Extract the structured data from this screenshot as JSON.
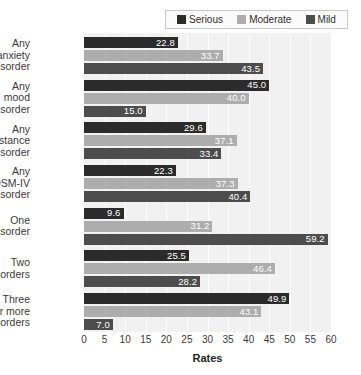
{
  "chart_data": {
    "type": "bar",
    "orientation": "horizontal",
    "title": "",
    "xlabel": "Rates",
    "ylabel": "",
    "xlim": [
      0,
      60
    ],
    "xticks": [
      0,
      5,
      10,
      15,
      20,
      25,
      30,
      35,
      40,
      45,
      50,
      55,
      60
    ],
    "grid": true,
    "legend_position": "top-right",
    "categories": [
      "Any anxiety disorder",
      "Any mood disorder",
      "Any substance use disorder",
      "Any DSM-IV disorder",
      "One disorder",
      "Two disorders",
      "Three or more disorders"
    ],
    "category_lines": [
      [
        "Any",
        "anxiety",
        "disorder"
      ],
      [
        "Any",
        "mood",
        "disorder"
      ],
      [
        "Any",
        "substance",
        "use disorder"
      ],
      [
        "Any",
        "DSM-IV",
        "disorder"
      ],
      [
        "One",
        "disorder"
      ],
      [
        "Two",
        "disorders"
      ],
      [
        "Three",
        "or more",
        "disorders"
      ]
    ],
    "series": [
      {
        "name": "Serious",
        "color": "#2b2b2b",
        "values": [
          22.8,
          45.0,
          29.6,
          22.3,
          9.6,
          25.5,
          49.9
        ],
        "labels": [
          "22.8",
          "45.0",
          "29.6",
          "22.3",
          "9.6",
          "25.5",
          "49.9"
        ]
      },
      {
        "name": "Moderate",
        "color": "#adadad",
        "values": [
          33.7,
          40.0,
          37.1,
          37.3,
          31.2,
          46.4,
          43.1
        ],
        "labels": [
          "33.7",
          "40.0",
          "37.1",
          "37.3",
          "31.2",
          "46.4",
          "43.1"
        ]
      },
      {
        "name": "Mild",
        "color": "#4d4d4d",
        "values": [
          43.5,
          15.0,
          33.4,
          40.4,
          59.2,
          28.2,
          7.0
        ],
        "labels": [
          "43.5",
          "15.0",
          "33.4",
          "40.4",
          "59.2",
          "28.2",
          "7.0"
        ]
      }
    ]
  },
  "colors": {
    "plot_background": "#f1f1f1",
    "page_background": "#ffffff",
    "gridline": "#ffffff",
    "band": "#dcdcdc",
    "axis_text": "#3a3a3a",
    "value_text": "#ffffff"
  }
}
